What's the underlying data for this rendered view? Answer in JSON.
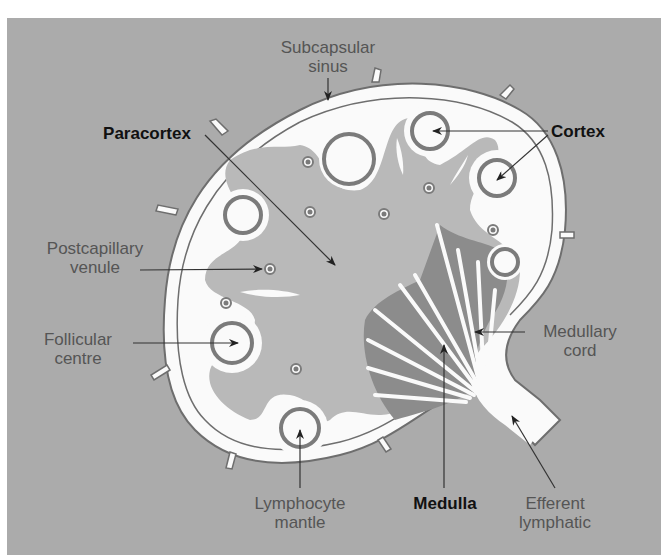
{
  "diagram": {
    "labels": {
      "subcapsular_sinus": [
        "Subcapsular",
        "sinus"
      ],
      "paracortex": "Paracortex",
      "cortex": "Cortex",
      "postcapillary_venule": [
        "Postcapillary",
        "venule"
      ],
      "follicular_centre": [
        "Follicular",
        "centre"
      ],
      "medullary_cord": [
        "Medullary",
        "cord"
      ],
      "lymphocyte_mantle": [
        "Lymphocyte",
        "mantle"
      ],
      "medulla": "Medulla",
      "efferent_lymphatic": [
        "Efferent",
        "lymphatic"
      ]
    },
    "colors": {
      "background": "#ababab",
      "capsule_white": "#fafafa",
      "paracortex_gray": "#b9b9b9",
      "medulla_dark": "#8c8c8c",
      "follicle_ring": "#7b7b7b",
      "outline": "#6e6e6e",
      "arrow": "#333333"
    }
  }
}
